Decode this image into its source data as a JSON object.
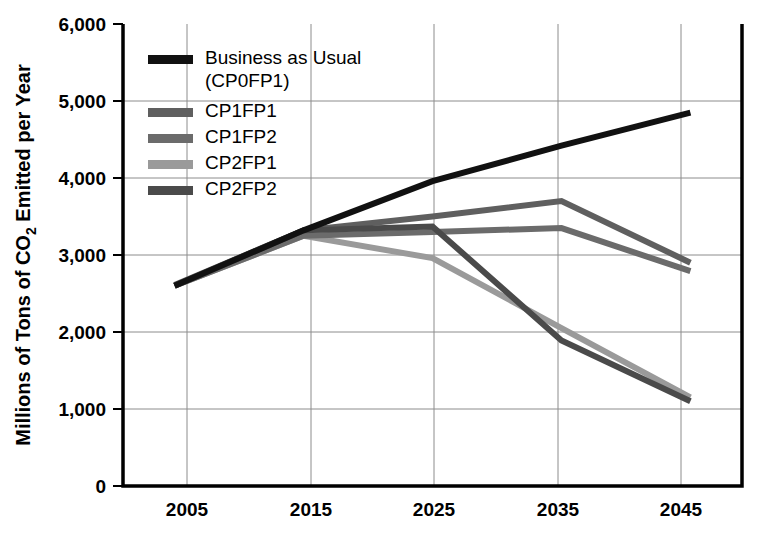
{
  "chart_data": {
    "type": "line",
    "title": "",
    "xlabel": "",
    "ylabel": "Millions of Tons of CO2 Emitted per Year",
    "ylabel_parts": {
      "before": "Millions of Tons of CO",
      "subscript": "2",
      "after": " Emitted per Year"
    },
    "x": [
      2005,
      2015,
      2025,
      2035,
      2045
    ],
    "xtick_labels": [
      "2005",
      "2015",
      "2025",
      "2035",
      "2045"
    ],
    "ytick_labels": [
      "0",
      "1,000",
      "2,000",
      "3,000",
      "4,000",
      "5,000",
      "6,000"
    ],
    "yticks": [
      0,
      1000,
      2000,
      3000,
      4000,
      5000,
      6000
    ],
    "ylim": [
      0,
      6000
    ],
    "xlim": [
      2001,
      2049
    ],
    "grid": true,
    "legend_position": "top-left-inside",
    "series": [
      {
        "name": "Business as Usual (CP0FP1)",
        "legend_label_line1": "Business as Usual",
        "legend_label_line2": "(CP0FP1)",
        "color": "#111111",
        "width": 6,
        "values": [
          2600,
          3320,
          3960,
          4420,
          4850
        ]
      },
      {
        "name": "CP1FP1",
        "legend_label_line1": "CP1FP1",
        "legend_label_line2": "",
        "color": "#5f5f5f",
        "width": 6,
        "values": [
          2610,
          3320,
          3500,
          3700,
          2900
        ]
      },
      {
        "name": "CP1FP2",
        "legend_label_line1": "CP1FP2",
        "legend_label_line2": "",
        "color": "#6b6b6b",
        "width": 6,
        "values": [
          2600,
          3250,
          3300,
          3350,
          2790
        ]
      },
      {
        "name": "CP2FP1",
        "legend_label_line1": "CP2FP1",
        "legend_label_line2": "",
        "color": "#9a9a9a",
        "width": 6,
        "values": [
          2600,
          3250,
          2960,
          2050,
          1150
        ]
      },
      {
        "name": "CP2FP2",
        "legend_label_line1": "CP2FP2",
        "legend_label_line2": "",
        "color": "#4a4a4a",
        "width": 6,
        "values": [
          2600,
          3320,
          3370,
          1890,
          1100
        ]
      }
    ]
  },
  "axes": {
    "y_axis_name": "y-axis",
    "x_axis_name": "x-axis"
  }
}
